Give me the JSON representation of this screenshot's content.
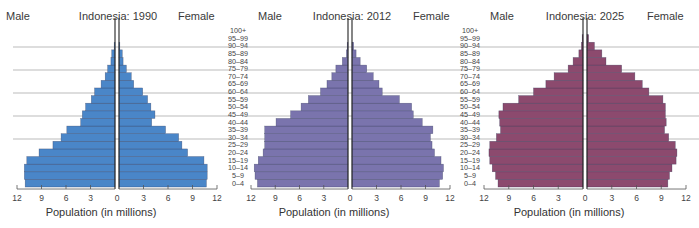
{
  "chart_data": [
    {
      "type": "bar",
      "subtype": "population-pyramid",
      "title": "Indonesia: 1990",
      "left_label": "Male",
      "right_label": "Female",
      "xlabel": "Population (in millions)",
      "xticks": [
        12,
        9,
        6,
        3,
        0,
        3,
        6,
        9,
        12
      ],
      "xlim": [
        0,
        12
      ],
      "color": "#4a86c8",
      "categories": [
        "0–4",
        "5–9",
        "10–14",
        "15–19",
        "20–24",
        "25–29",
        "30–34",
        "35–39",
        "40–44",
        "45–49",
        "50–54",
        "55–59",
        "60–64",
        "65–69",
        "70–74",
        "75–79",
        "80–84",
        "85–89",
        "90–94",
        "95–99",
        "100+"
      ],
      "series": [
        {
          "name": "Male",
          "values": [
            11.0,
            11.1,
            11.1,
            10.8,
            9.3,
            7.6,
            6.6,
            5.9,
            4.2,
            4.0,
            3.6,
            2.9,
            2.5,
            1.7,
            1.2,
            0.9,
            0.5,
            0.4,
            0.1,
            0.0,
            0.0
          ]
        },
        {
          "name": "Female",
          "values": [
            10.7,
            10.8,
            10.8,
            10.4,
            8.4,
            7.7,
            7.3,
            5.7,
            4.0,
            4.4,
            3.9,
            3.5,
            2.9,
            1.8,
            1.5,
            0.9,
            0.5,
            0.4,
            0.1,
            0.0,
            0.0
          ]
        }
      ]
    },
    {
      "type": "bar",
      "subtype": "population-pyramid",
      "title": "Indonesia: 2012",
      "left_label": "Male",
      "right_label": "Female",
      "xlabel": "Population (in millions)",
      "xticks": [
        12,
        9,
        6,
        3,
        0,
        3,
        6,
        9,
        12
      ],
      "xlim": [
        0,
        12
      ],
      "color": "#7a74ad",
      "categories": [
        "0–4",
        "5–9",
        "10–14",
        "15–19",
        "20–24",
        "25–29",
        "30–34",
        "35–39",
        "40–44",
        "45–49",
        "50–54",
        "55–59",
        "60–64",
        "65–69",
        "70–74",
        "75–79",
        "80–84",
        "85–89",
        "90–94",
        "95–99",
        "100+"
      ],
      "series": [
        {
          "name": "Male",
          "values": [
            11.2,
            11.5,
            11.6,
            11.1,
            10.5,
            10.3,
            10.3,
            10.3,
            8.9,
            7.1,
            5.8,
            4.9,
            3.4,
            2.6,
            2.0,
            1.5,
            0.7,
            0.2,
            0.1,
            0.0,
            0.0
          ]
        },
        {
          "name": "Female",
          "values": [
            10.7,
            11.1,
            11.2,
            10.9,
            10.1,
            9.8,
            9.6,
            9.9,
            8.6,
            7.5,
            7.3,
            5.8,
            3.7,
            3.3,
            2.6,
            1.8,
            1.0,
            0.5,
            0.2,
            0.0,
            0.0
          ]
        }
      ]
    },
    {
      "type": "bar",
      "subtype": "population-pyramid",
      "title": "Indonesia: 2025",
      "left_label": "Male",
      "right_label": "Female",
      "xlabel": "Population (in millions)",
      "xticks": [
        12,
        9,
        6,
        3,
        0,
        3,
        6,
        9,
        12
      ],
      "xlim": [
        0,
        12
      ],
      "color": "#8c4a6e",
      "categories": [
        "0–4",
        "5–9",
        "10–14",
        "15–19",
        "20–24",
        "25–29",
        "30–34",
        "35–39",
        "40–44",
        "45–49",
        "50–54",
        "55–59",
        "60–64",
        "65–69",
        "70–74",
        "75–79",
        "80–84",
        "85–89",
        "90–94",
        "95–99",
        "100+"
      ],
      "series": [
        {
          "name": "Male",
          "values": [
            10.3,
            10.6,
            11.0,
            11.3,
            11.4,
            11.3,
            10.5,
            10.0,
            10.1,
            10.2,
            9.7,
            7.8,
            6.0,
            4.5,
            3.5,
            1.8,
            1.2,
            0.5,
            0.2,
            0.1,
            0.0
          ]
        },
        {
          "name": "Female",
          "values": [
            9.8,
            10.0,
            10.3,
            10.8,
            10.9,
            10.7,
            9.9,
            9.4,
            9.6,
            9.5,
            9.5,
            9.2,
            7.5,
            6.7,
            5.8,
            4.2,
            2.3,
            1.8,
            0.9,
            0.2,
            0.0
          ]
        }
      ]
    }
  ],
  "ui": {
    "pyramids": [
      {
        "title": "Indonesia: 1990",
        "male": "Male",
        "female": "Female",
        "xlabel": "Population (in millions)"
      },
      {
        "title": "Indonesia: 2012",
        "male": "Male",
        "female": "Female",
        "xlabel": "Population (in millions)"
      },
      {
        "title": "Indonesia: 2025",
        "male": "Male",
        "female": "Female",
        "xlabel": "Population (in millions)"
      }
    ]
  }
}
